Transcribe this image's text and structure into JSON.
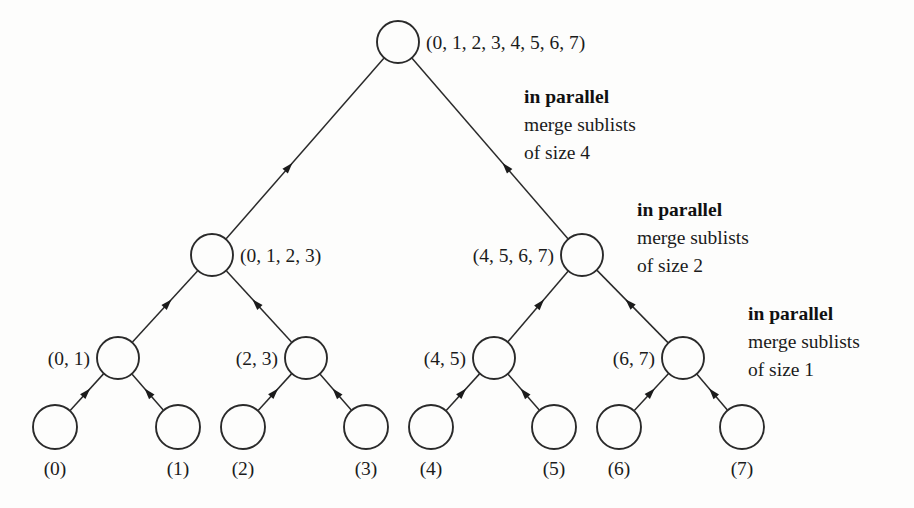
{
  "diagram": {
    "type": "binary-merge-tree",
    "background_color": "#fdfdfc",
    "stroke_color": "#2a2a2a",
    "text_color": "#1b1b1b"
  },
  "levels": [
    {
      "level": 0,
      "name": "root-level",
      "nodes": [
        {
          "id": "root",
          "label": "(0, 1, 2, 3, 4, 5, 6, 7)",
          "label_side": "right",
          "cx": 398,
          "cy": 42,
          "r": 21
        }
      ]
    },
    {
      "level": 1,
      "name": "half-level",
      "nodes": [
        {
          "id": "left-half",
          "label": "(0, 1, 2, 3)",
          "label_side": "right",
          "cx": 212,
          "cy": 255,
          "r": 21
        },
        {
          "id": "right-half",
          "label": "(4, 5, 6, 7)",
          "label_side": "left",
          "cx": 582,
          "cy": 255,
          "r": 21
        }
      ]
    },
    {
      "level": 2,
      "name": "pair-level",
      "nodes": [
        {
          "id": "pair-01",
          "label": "(0, 1)",
          "label_side": "left",
          "cx": 118,
          "cy": 358,
          "r": 21
        },
        {
          "id": "pair-23",
          "label": "(2, 3)",
          "label_side": "left",
          "cx": 306,
          "cy": 358,
          "r": 21
        },
        {
          "id": "pair-45",
          "label": "(4, 5)",
          "label_side": "left",
          "cx": 494,
          "cy": 358,
          "r": 21
        },
        {
          "id": "pair-67",
          "label": "(6, 7)",
          "label_side": "left",
          "cx": 683,
          "cy": 358,
          "r": 21
        }
      ]
    },
    {
      "level": 3,
      "name": "leaf-level",
      "nodes": [
        {
          "id": "leaf-0",
          "label": "(0)",
          "label_side": "below",
          "cx": 55,
          "cy": 427,
          "r": 22
        },
        {
          "id": "leaf-1",
          "label": "(1)",
          "label_side": "below",
          "cx": 178,
          "cy": 427,
          "r": 22
        },
        {
          "id": "leaf-2",
          "label": "(2)",
          "label_side": "below",
          "cx": 243,
          "cy": 427,
          "r": 22
        },
        {
          "id": "leaf-3",
          "label": "(3)",
          "label_side": "below",
          "cx": 366,
          "cy": 427,
          "r": 22
        },
        {
          "id": "leaf-4",
          "label": "(4)",
          "label_side": "below",
          "cx": 431,
          "cy": 427,
          "r": 22
        },
        {
          "id": "leaf-5",
          "label": "(5)",
          "label_side": "below",
          "cx": 554,
          "cy": 427,
          "r": 22
        },
        {
          "id": "leaf-6",
          "label": "(6)",
          "label_side": "below",
          "cx": 619,
          "cy": 427,
          "r": 22
        },
        {
          "id": "leaf-7",
          "label": "(7)",
          "label_side": "below",
          "cx": 742,
          "cy": 427,
          "r": 22
        }
      ]
    }
  ],
  "edges": [
    {
      "from": "left-half",
      "to": "root",
      "arrow": "to-parent"
    },
    {
      "from": "right-half",
      "to": "root",
      "arrow": "to-parent"
    },
    {
      "from": "pair-01",
      "to": "left-half",
      "arrow": "to-parent"
    },
    {
      "from": "pair-23",
      "to": "left-half",
      "arrow": "to-parent"
    },
    {
      "from": "pair-45",
      "to": "right-half",
      "arrow": "to-parent"
    },
    {
      "from": "pair-67",
      "to": "right-half",
      "arrow": "to-parent"
    },
    {
      "from": "leaf-0",
      "to": "pair-01",
      "arrow": "to-parent"
    },
    {
      "from": "leaf-1",
      "to": "pair-01",
      "arrow": "to-parent"
    },
    {
      "from": "leaf-2",
      "to": "pair-23",
      "arrow": "to-parent"
    },
    {
      "from": "leaf-3",
      "to": "pair-23",
      "arrow": "to-parent"
    },
    {
      "from": "leaf-4",
      "to": "pair-45",
      "arrow": "to-parent"
    },
    {
      "from": "leaf-5",
      "to": "pair-45",
      "arrow": "to-parent"
    },
    {
      "from": "leaf-6",
      "to": "pair-67",
      "arrow": "to-parent"
    },
    {
      "from": "leaf-7",
      "to": "pair-67",
      "arrow": "to-parent"
    }
  ],
  "annotations": [
    {
      "id": "anno-size-4",
      "title": "in parallel",
      "line2": "merge sublists",
      "line3": "of size 4",
      "x": 524,
      "y": 103
    },
    {
      "id": "anno-size-2",
      "title": "in parallel",
      "line2": "merge sublists",
      "line3": "of size 2",
      "x": 637,
      "y": 216
    },
    {
      "id": "anno-size-1",
      "title": "in parallel",
      "line2": "merge sublists",
      "line3": "of size 1",
      "x": 748,
      "y": 320
    }
  ]
}
